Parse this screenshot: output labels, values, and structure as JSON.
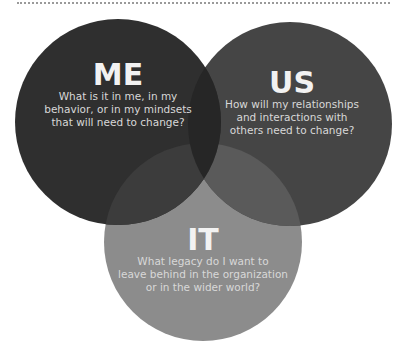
{
  "diagram": {
    "type": "venn",
    "circles": [
      {
        "id": "me",
        "title": "ME",
        "question": "What is it in me, in my behavior, or in my mindsets that will need to change?",
        "question_lines": [
          "What is it in me, in my",
          "behavior, or in my mindsets",
          "that will need to change?"
        ],
        "color": "#2f2f2f",
        "cx": 118,
        "cy": 122,
        "r": 103
      },
      {
        "id": "us",
        "title": "US",
        "question": "How will my relationships and interactions with others need to change?",
        "question_lines": [
          "How will my relationships",
          "and interactions with",
          "others need to change?"
        ],
        "color": "#454545",
        "cx": 290,
        "cy": 124,
        "r": 102
      },
      {
        "id": "it",
        "title": "IT",
        "question": "What legacy do I want to leave behind in the organization or in the wider world?",
        "question_lines": [
          "What legacy do I want to",
          "leave behind in the organization",
          "or in the wider world?"
        ],
        "color": "#8c8c8c",
        "cx": 203,
        "cy": 242,
        "r": 99
      }
    ],
    "overlap_colors": {
      "me_us": "#262626",
      "me_it": "#3c3c3c",
      "us_it": "#5a5a5a"
    },
    "top_rule_color": "#9a9a9a"
  }
}
